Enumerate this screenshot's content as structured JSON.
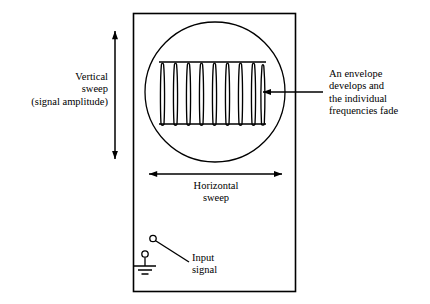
{
  "figure": {
    "type": "oscilloscope-sweep-diagram",
    "background_color": "#ffffff",
    "line_color": "#000000"
  },
  "labels": {
    "vertical_sweep": "Vertical\nsweep\n(signal amplitude)",
    "horizontal_sweep": "Horizontal\nsweep",
    "envelope_annotation": "An envelope\ndevelops and\nthe individual\nfrequencies fade",
    "input_signal": "Input\nsignal"
  },
  "components": {
    "enclosure": {
      "name": "oscilloscope-case",
      "x": 133,
      "y": 13,
      "width": 163,
      "height": 279
    },
    "screen": {
      "name": "crt-screen",
      "cx": 215,
      "cy": 92,
      "r": 70
    },
    "waveform": {
      "name": "signal-trace",
      "x_start": 160,
      "x_end": 265,
      "top_envelope_y": 62,
      "bottom_envelope_y": 124,
      "oscillation_count": 8,
      "description": "dense vertical oscillations bounded by flat top and bottom envelope lines"
    },
    "vertical_arrow": {
      "name": "vertical-sweep-arrow",
      "x": 115,
      "y_top": 30,
      "y_bottom": 160,
      "double_headed": true
    },
    "horizontal_arrow": {
      "name": "horizontal-sweep-arrow",
      "y": 174,
      "x_left": 148,
      "x_right": 283,
      "double_headed": true
    },
    "pointer_arrow": {
      "name": "envelope-pointer-arrow",
      "y": 92,
      "x_tail": 322,
      "x_head": 262,
      "double_headed": false
    },
    "input_terminal": {
      "name": "input-signal-switch",
      "open_terminal": {
        "cx": 153,
        "cy": 239,
        "r": 3.2
      },
      "pivot_terminal": {
        "cx": 145,
        "cy": 254,
        "r": 3.2
      },
      "ground_stem_y": 266,
      "ground_bars": [
        {
          "half_width": 11
        },
        {
          "half_width": 7
        },
        {
          "half_width": 3.5
        }
      ],
      "leader_from": {
        "x": 156,
        "y": 242
      },
      "leader_to": {
        "x": 189,
        "y": 262
      }
    }
  }
}
